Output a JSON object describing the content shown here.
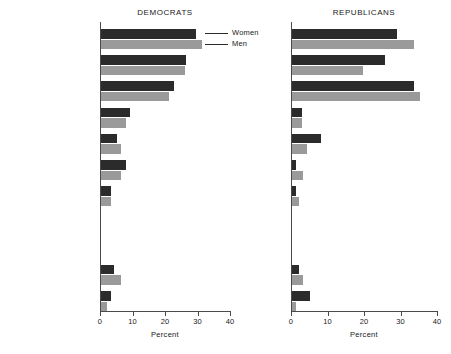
{
  "figure": {
    "width": 451,
    "height": 354,
    "background": "#ffffff"
  },
  "legend": {
    "position": "top-right-of-left-panel",
    "entries": [
      {
        "label": "Women",
        "color": "#2b2b2b",
        "key": "women"
      },
      {
        "label": "Men",
        "color": "#9a9a9a",
        "key": "men"
      }
    ]
  },
  "chart_data": {
    "type": "bar",
    "orientation": "horizontal",
    "title": "",
    "xlabel": "Percent",
    "ylabel": "",
    "xlim": [
      0,
      40
    ],
    "xticks": [
      0,
      10,
      20,
      30,
      40
    ],
    "xticklabels": [
      "0",
      "10",
      "20",
      "30",
      "40"
    ],
    "grid": false,
    "legend_entries": [
      "Women",
      "Men"
    ],
    "legend_position": "upper right (left panel)",
    "categories": [
      "Economy",
      "Social welfare",
      "Taxes and spending",
      "Defense and security",
      "Civil and social order",
      "Government functioning",
      "Foreign affairs",
      "Race and social groups",
      "",
      "Men's issues",
      "Women's issues"
    ],
    "panels": [
      {
        "name": "DEMOCRATS",
        "title": "DEMOCRATS",
        "series": [
          {
            "name": "Women",
            "color": "#2b2b2b",
            "values": [
              29.2,
              26.0,
              22.5,
              8.8,
              4.8,
              7.8,
              3.0,
              0.0,
              0.0,
              4.0,
              3.0
            ]
          },
          {
            "name": "Men",
            "color": "#9a9a9a",
            "values": [
              31.0,
              25.8,
              21.0,
              7.8,
              6.0,
              6.0,
              3.0,
              0.0,
              0.0,
              6.0,
              1.8
            ]
          }
        ]
      },
      {
        "name": "REPUBLICANS",
        "title": "REPUBLICANS",
        "series": [
          {
            "name": "Women",
            "color": "#2b2b2b",
            "values": [
              28.8,
              25.5,
              33.5,
              2.8,
              8.0,
              1.0,
              1.0,
              0.0,
              0.0,
              2.0,
              5.0
            ]
          },
          {
            "name": "Men",
            "color": "#9a9a9a",
            "values": [
              33.4,
              19.5,
              35.2,
              2.8,
              4.0,
              3.0,
              2.0,
              0.0,
              0.0,
              3.0,
              1.0
            ]
          }
        ]
      }
    ]
  }
}
